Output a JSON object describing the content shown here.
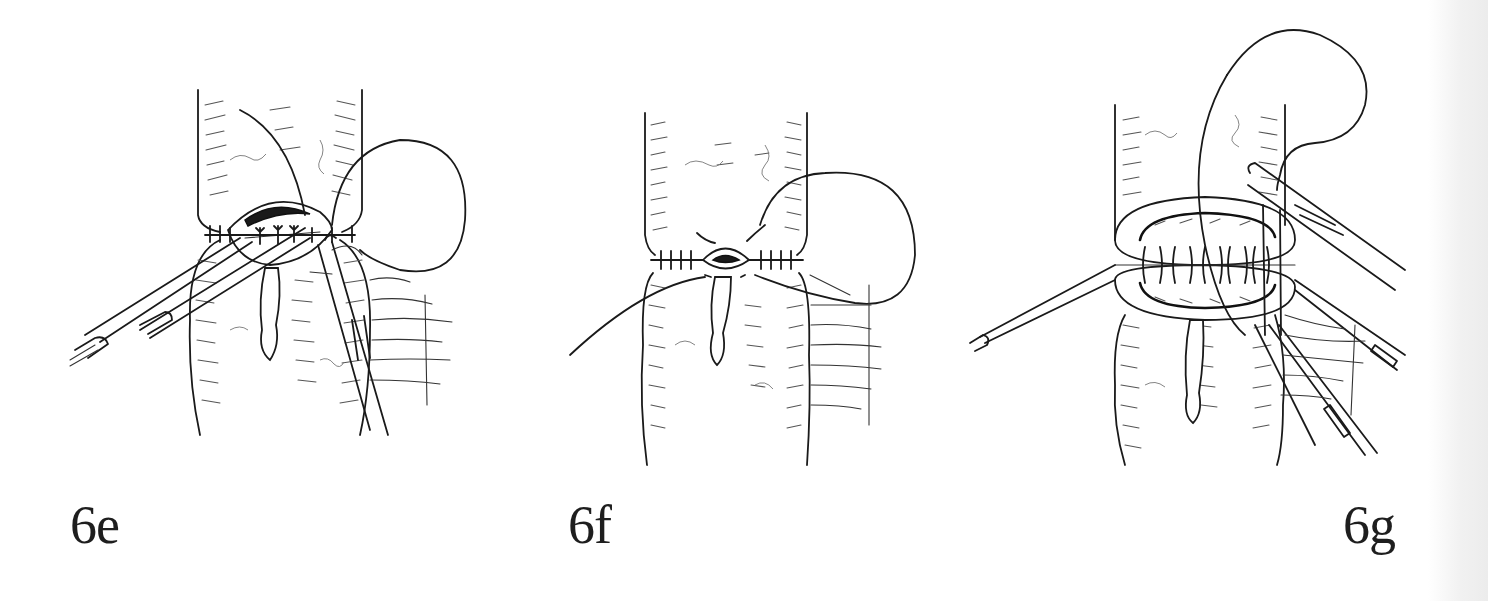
{
  "page": {
    "background": "#ffffff",
    "ink_color": "#1a1a1a",
    "gutter_color": "#ececec"
  },
  "figures": [
    {
      "id": "6e",
      "label": "6e",
      "illustration": "bowel-anastomosis-posterior-suture-row-with-forceps-and-needle-holder"
    },
    {
      "id": "6f",
      "label": "6f",
      "illustration": "bowel-anastomosis-nearly-closed-with-continuous-suture"
    },
    {
      "id": "6g",
      "label": "6g",
      "illustration": "bowel-anastomosis-interrupted-sutures-with-stay-sutures-and-needle-holder"
    }
  ]
}
